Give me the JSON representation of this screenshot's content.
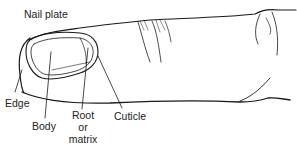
{
  "diagram": {
    "labels": {
      "nail_plate": "Nail plate",
      "edge": "Edge",
      "body": "Body",
      "root_line1": "Root",
      "root_line2": "or",
      "root_line3": "matrix",
      "cuticle": "Cuticle"
    },
    "colors": {
      "line": "#1a1a1a",
      "text": "#222222",
      "background": "#ffffff"
    }
  }
}
